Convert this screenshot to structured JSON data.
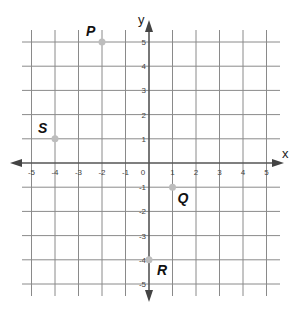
{
  "chart_data": {
    "type": "scatter",
    "title": "",
    "xlabel": "x",
    "ylabel": "y",
    "xlim": [
      -5,
      5
    ],
    "ylim": [
      -5,
      5
    ],
    "grid": true,
    "x_ticks": [
      "-5",
      "-4",
      "-3",
      "-2",
      "-1",
      "0",
      "1",
      "2",
      "3",
      "4",
      "5"
    ],
    "y_ticks": [
      "5",
      "4",
      "3",
      "2",
      "1",
      "-1",
      "-2",
      "-3",
      "-4",
      "-5"
    ],
    "points": [
      {
        "label": "P",
        "x": -2,
        "y": 5
      },
      {
        "label": "S",
        "x": -4,
        "y": 1
      },
      {
        "label": "Q",
        "x": 1,
        "y": -1
      },
      {
        "label": "R",
        "x": 0,
        "y": -4
      }
    ],
    "colors": {
      "grid": "#8a8a8a",
      "axis": "#555555",
      "point": "#bdbdbd"
    }
  }
}
